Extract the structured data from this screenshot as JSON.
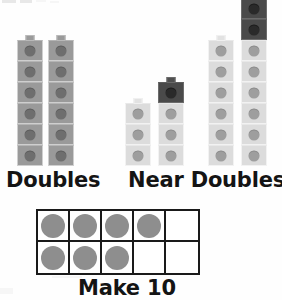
{
  "worksheet": {
    "title": "Doubles, Near Doubles and Make 10 strategy poster",
    "background_color": "#ffffff"
  },
  "colors": {
    "cube_medium": "#9a9a9a",
    "cube_light": "#dcdcdc",
    "cube_dark": "#4a4a4a",
    "stud_medium": "#6e6e6e",
    "stud_light": "#9e9e9e",
    "stud_dark": "#2a2a2a",
    "frame_line": "#1a1a1a",
    "frame_dot": "#8e8e8e",
    "caption_text": "#141414"
  },
  "sections": [
    {
      "id": "doubles",
      "caption": "Doubles",
      "caption_left": 6,
      "caption_top": 168,
      "caption_size": 21,
      "towers": [
        {
          "name": "doubles-tower-left",
          "left": 17,
          "count": 6,
          "segments": [
            {
              "color": "medium",
              "count": 6
            }
          ]
        },
        {
          "name": "doubles-tower-right",
          "left": 48,
          "count": 6,
          "segments": [
            {
              "color": "medium",
              "count": 6
            }
          ]
        }
      ]
    },
    {
      "id": "near-doubles",
      "caption": "Near Doubles",
      "caption_left": 128,
      "caption_top": 168,
      "caption_size": 21,
      "towers": [
        {
          "name": "near-doubles-tower-a",
          "left": 125,
          "count": 3,
          "segments": [
            {
              "color": "light",
              "count": 3
            }
          ]
        },
        {
          "name": "near-doubles-tower-b",
          "left": 158,
          "count": 4,
          "segments": [
            {
              "color": "light",
              "count": 3
            },
            {
              "color": "dark",
              "count": 1
            }
          ]
        },
        {
          "name": "near-doubles-tower-c",
          "left": 208,
          "count": 6,
          "segments": [
            {
              "color": "light",
              "count": 6
            }
          ]
        },
        {
          "name": "near-doubles-tower-d",
          "left": 241,
          "count": 8,
          "segments": [
            {
              "color": "light",
              "count": 6
            },
            {
              "color": "dark",
              "count": 2
            }
          ]
        }
      ]
    }
  ],
  "cube_metrics": {
    "width": 26,
    "height": 21,
    "stud_diameter": 11,
    "nub_width": 9,
    "nub_height": 6,
    "baseline_y": 166
  },
  "ten_frame": {
    "caption": "Make 10",
    "caption_left": 78,
    "caption_top": 276,
    "caption_size": 21,
    "left": 36,
    "top": 209,
    "columns": 5,
    "rows": 2,
    "cell_width": 32,
    "cell_height": 31,
    "dot_diameter": 24,
    "filled_total": 7,
    "cells": [
      [
        true,
        true,
        true,
        true,
        false
      ],
      [
        true,
        true,
        true,
        false,
        false
      ]
    ]
  },
  "artifacts": [
    {
      "name": "page-bleed-top-left",
      "left": 2,
      "top": 0,
      "width": 14,
      "height": 3,
      "soft": false
    },
    {
      "name": "page-bleed-top-left-2",
      "left": 20,
      "top": 0,
      "width": 12,
      "height": 3,
      "soft": false
    },
    {
      "name": "page-bleed-top-left-3",
      "left": 36,
      "top": 0,
      "width": 10,
      "height": 2,
      "soft": true
    },
    {
      "name": "page-bleed-top-left-4",
      "left": 50,
      "top": 1,
      "width": 9,
      "height": 2,
      "soft": true
    },
    {
      "name": "page-bleed-bottom-left",
      "left": 0,
      "top": 288,
      "width": 13,
      "height": 6,
      "soft": true
    },
    {
      "name": "page-bleed-bottom-edge",
      "left": 52,
      "top": 276,
      "width": 30,
      "height": 2,
      "soft": true
    }
  ]
}
